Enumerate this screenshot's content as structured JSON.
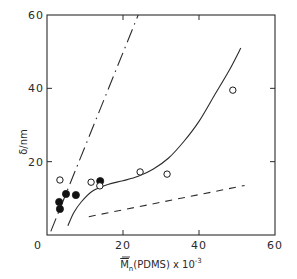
{
  "chart_data": {
    "type": "scatter",
    "title": "",
    "xlabel": "M̄n(PDMS) x 10^-3",
    "xlabel_parts": {
      "main": "M",
      "sub": "n",
      "rest": "(PDMS) x 10",
      "sup": "-3"
    },
    "ylabel": "δ/nm",
    "xlim": [
      0,
      60
    ],
    "ylim": [
      0,
      60
    ],
    "x_ticks": [
      0,
      20,
      40,
      60
    ],
    "y_ticks": [
      0,
      20,
      40,
      60
    ],
    "x_tick_labels": [
      "0",
      "20",
      "40",
      "60"
    ],
    "y_tick_labels": [
      "0",
      "20",
      "40",
      "60"
    ],
    "grid": false,
    "legend": null,
    "series": [
      {
        "name": "filled circles",
        "marker": "filled-circle",
        "points": [
          [
            3.2,
            9.0
          ],
          [
            3.4,
            7.1
          ],
          [
            5.0,
            11.2
          ],
          [
            7.6,
            10.9
          ],
          [
            14.0,
            14.7
          ]
        ]
      },
      {
        "name": "open circles",
        "marker": "open-circle",
        "points": [
          [
            3.4,
            15.0
          ],
          [
            11.6,
            14.4
          ],
          [
            13.9,
            13.4
          ],
          [
            24.5,
            17.2
          ],
          [
            31.6,
            16.6
          ],
          [
            48.9,
            39.5
          ]
        ]
      },
      {
        "name": "solid curve",
        "style": "solid",
        "points": [
          [
            5.5,
            2.5
          ],
          [
            7,
            6
          ],
          [
            9,
            9
          ],
          [
            12,
            12
          ],
          [
            16,
            13.8
          ],
          [
            20,
            14.8
          ],
          [
            24,
            16
          ],
          [
            28,
            18
          ],
          [
            32,
            21
          ],
          [
            36,
            25.5
          ],
          [
            40,
            31
          ],
          [
            44,
            38
          ],
          [
            48,
            45
          ],
          [
            51,
            51
          ]
        ]
      },
      {
        "name": "dash-dot line",
        "style": "dash-dot",
        "points": [
          [
            1,
            1
          ],
          [
            24,
            60
          ]
        ]
      },
      {
        "name": "dashed line",
        "style": "dashed",
        "points": [
          [
            11,
            5
          ],
          [
            52,
            13.5
          ]
        ]
      }
    ]
  }
}
